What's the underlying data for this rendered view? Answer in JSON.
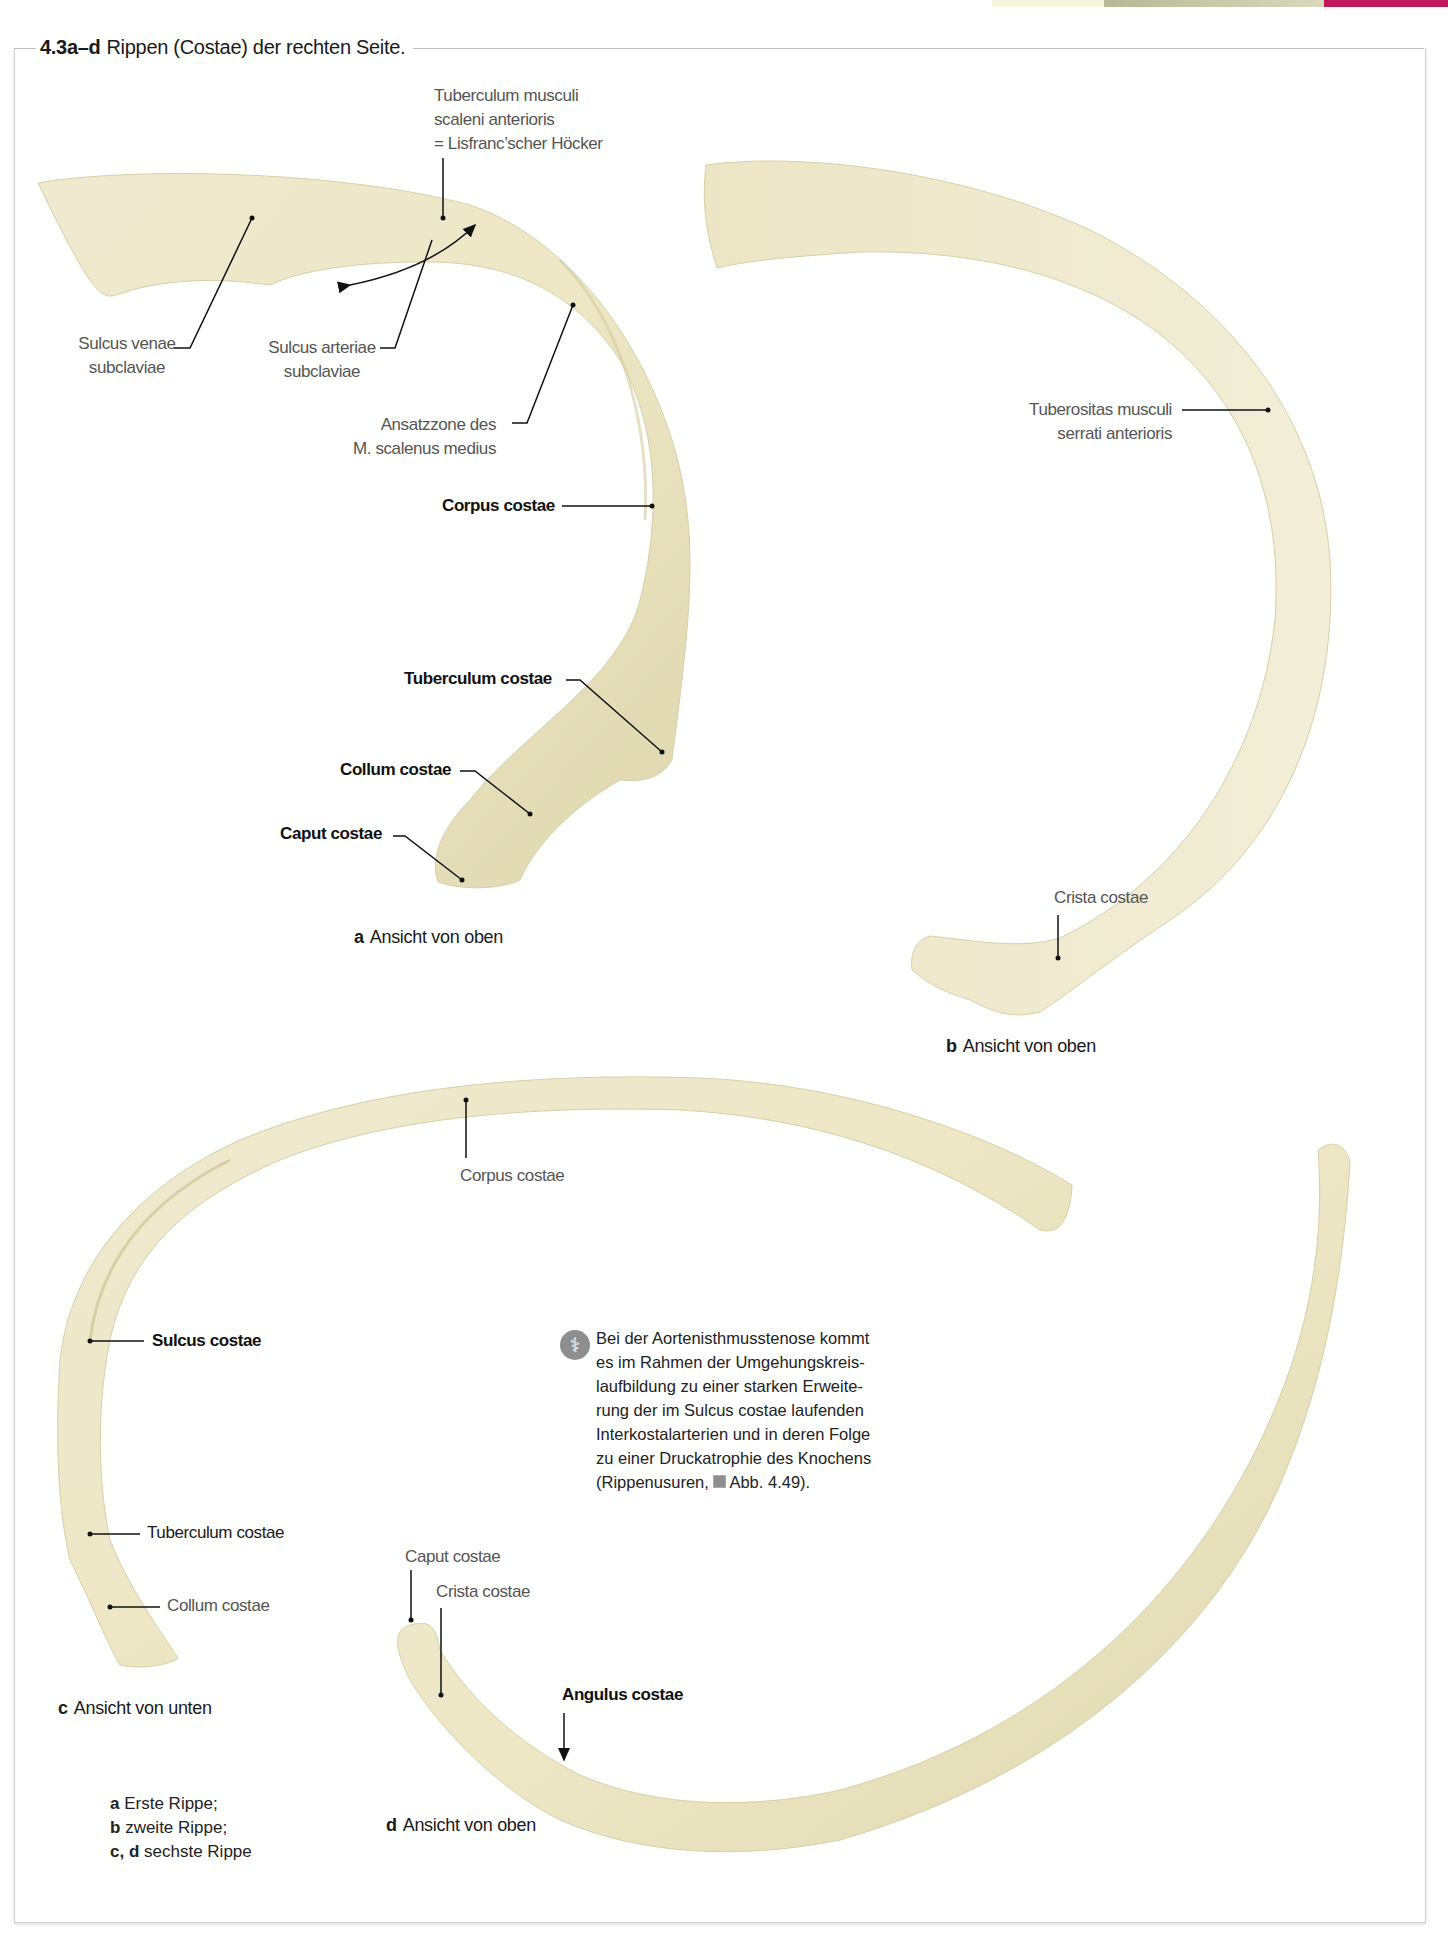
{
  "header": {
    "figure_number": "4.3a–d",
    "figure_title": "Rippen (Costae) der rechten Seite.",
    "accent_colors": [
      "#f7f5dc",
      "#c9c9a8",
      "#c2185b"
    ]
  },
  "panel_a": {
    "caption_letter": "a",
    "caption_text": "Ansicht von oben",
    "labels": {
      "tuberculum_scaleni_1": "Tuberculum musculi",
      "tuberculum_scaleni_2": "scaleni anterioris",
      "tuberculum_scaleni_3": "= Lisfranc’scher Höcker",
      "sulcus_venae_1": "Sulcus venae",
      "sulcus_venae_2": "subclaviae",
      "sulcus_arteriae_1": "Sulcus arteriae",
      "sulcus_arteriae_2": "subclaviae",
      "ansatzzone_1": "Ansatzzone des",
      "ansatzzone_2": "M. scalenus medius",
      "corpus": "Corpus costae",
      "tuberculum": "Tuberculum costae",
      "collum": "Collum costae",
      "caput": "Caput costae"
    }
  },
  "panel_b": {
    "caption_letter": "b",
    "caption_text": "Ansicht von oben",
    "labels": {
      "tuberositas_1": "Tuberositas musculi",
      "tuberositas_2": "serrati anterioris",
      "crista": "Crista costae"
    }
  },
  "panel_c": {
    "caption_letter": "c",
    "caption_text": "Ansicht von unten",
    "labels": {
      "corpus": "Corpus costae",
      "sulcus": "Sulcus costae",
      "tuberculum": "Tuberculum costae",
      "collum": "Collum costae"
    }
  },
  "panel_d": {
    "caption_letter": "d",
    "caption_text": "Ansicht von oben",
    "labels": {
      "caput": "Caput costae",
      "crista": "Crista costae",
      "angulus": "Angulus costae"
    }
  },
  "clinical_note": {
    "icon": "caduceus-icon",
    "lines": [
      "Bei der Aortenisthmusstenose kommt",
      "es im Rahmen der Umgehungskreis-",
      "laufbildung zu einer starken Erweite-",
      "rung der im Sulcus costae laufenden",
      "Interkostalarterien und in deren Folge",
      "zu einer Druckatrophie des Knochens"
    ],
    "last_line_prefix": "(Rippenusuren,",
    "reference": "Abb. 4.49",
    "last_line_suffix": ")."
  },
  "legend": {
    "items": [
      {
        "key": "a",
        "text": "Erste Rippe;"
      },
      {
        "key": "b",
        "text": "zweite Rippe;"
      },
      {
        "key": "c, d",
        "text": "sechste Rippe"
      }
    ]
  },
  "colors": {
    "bone_light": "#f3efd6",
    "bone_mid": "#e6e0bd",
    "bone_shadow": "#cfc79d",
    "leader_line": "#111111",
    "gray_label": "#555555"
  }
}
